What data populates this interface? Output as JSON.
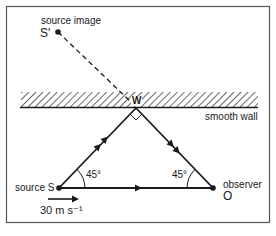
{
  "diagram": {
    "type": "physics-doppler-reflection",
    "labels": {
      "source_image": "source image",
      "source_image_symbol": "S′",
      "wall_point": "W",
      "wall": "smooth wall",
      "source": "source S",
      "observer": "observer",
      "observer_symbol": "O",
      "angle_at_source": "45°",
      "angle_at_observer": "45°",
      "velocity": "30 m s⁻¹"
    },
    "points": {
      "S_prime": {
        "x": 58,
        "y": 32
      },
      "W": {
        "x": 136,
        "y": 107
      },
      "S": {
        "x": 59,
        "y": 188
      },
      "O": {
        "x": 213,
        "y": 188
      }
    },
    "colors": {
      "ink": "#1a1a1a",
      "frame": "#555555",
      "background": "#ffffff"
    }
  }
}
